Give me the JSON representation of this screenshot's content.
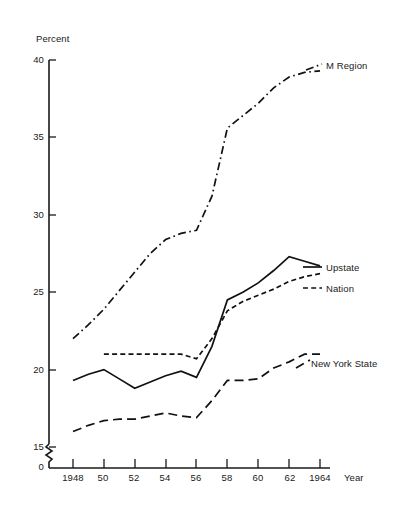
{
  "chart_data": {
    "type": "line",
    "title": "",
    "subtitle": "",
    "xlabel": "Year",
    "ylabel": "Percent",
    "grid": false,
    "legend_position": "right-inline-labels",
    "axis_break": true,
    "axis_break_note": "y-axis broken between 0 and 15",
    "xlim": [
      1948,
      1964
    ],
    "ylim": [
      15,
      40
    ],
    "y_ticks": [
      15,
      20,
      25,
      30,
      35,
      40
    ],
    "y_tick_labels": [
      "15",
      "20",
      "25",
      "30",
      "35",
      "40"
    ],
    "y_origin_label": "0",
    "x": [
      1948,
      1949,
      1950,
      1951,
      1952,
      1953,
      1954,
      1955,
      1956,
      1957,
      1958,
      1959,
      1960,
      1961,
      1962,
      1963,
      1964
    ],
    "x_ticks": [
      1948,
      1950,
      1952,
      1954,
      1956,
      1958,
      1960,
      1962,
      1964
    ],
    "x_tick_labels": [
      "1948",
      "50",
      "52",
      "54",
      "56",
      "58",
      "60",
      "62",
      "1964"
    ],
    "series": [
      {
        "name": "M Region",
        "style": "dash-dot",
        "color": "#111111",
        "values": [
          22.0,
          22.9,
          23.9,
          25.1,
          26.3,
          27.5,
          28.4,
          28.8,
          29.0,
          31.2,
          35.6,
          36.4,
          37.2,
          38.2,
          38.9,
          39.2,
          39.3
        ]
      },
      {
        "name": "Upstate",
        "style": "solid",
        "color": "#111111",
        "values": [
          19.3,
          19.7,
          20.0,
          19.4,
          18.8,
          19.2,
          19.6,
          19.9,
          19.5,
          21.5,
          24.5,
          25.0,
          25.6,
          26.4,
          27.3,
          27.0,
          26.7
        ]
      },
      {
        "name": "Nation",
        "style": "short-dash",
        "color": "#111111",
        "values": [
          null,
          null,
          21.0,
          21.0,
          21.0,
          21.0,
          21.0,
          21.0,
          20.7,
          22.0,
          23.8,
          24.4,
          24.8,
          25.2,
          25.7,
          26.0,
          26.2
        ]
      },
      {
        "name": "New York State",
        "style": "long-dash",
        "color": "#111111",
        "values": [
          16.0,
          16.4,
          16.7,
          16.8,
          16.8,
          17.0,
          17.2,
          17.0,
          16.9,
          18.0,
          19.3,
          19.3,
          19.4,
          20.1,
          20.5,
          21.0,
          21.0
        ]
      }
    ]
  },
  "labels": {
    "y_axis_title": "Percent",
    "x_axis_title": "Year",
    "series_m_region": "M Region",
    "series_upstate": "Upstate",
    "series_nation": "Nation",
    "series_new_york_state": "New York State",
    "y_ticks": [
      "40",
      "35",
      "30",
      "25",
      "20",
      "15"
    ],
    "y_zero": "0",
    "x_ticks": [
      "1948",
      "50",
      "52",
      "54",
      "56",
      "58",
      "60",
      "62",
      "1964"
    ]
  }
}
